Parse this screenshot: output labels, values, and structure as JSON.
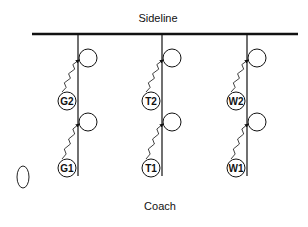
{
  "diagram": {
    "top_label": "Sideline",
    "bottom_label": "Coach",
    "columns": [
      {
        "x": 78,
        "players": [
          {
            "label": "G2",
            "cy": 101
          },
          {
            "label": "G1",
            "cy": 168
          }
        ]
      },
      {
        "x": 162,
        "players": [
          {
            "label": "T2",
            "cy": 101
          },
          {
            "label": "T1",
            "cy": 168
          }
        ]
      },
      {
        "x": 247,
        "players": [
          {
            "label": "W2",
            "cy": 101
          },
          {
            "label": "W1",
            "cy": 168
          }
        ]
      }
    ],
    "targets_cy": [
      58,
      122
    ],
    "ball": {
      "cx": 23,
      "cy": 177
    },
    "colors": {
      "line": "#111111",
      "background": "#ffffff"
    }
  }
}
